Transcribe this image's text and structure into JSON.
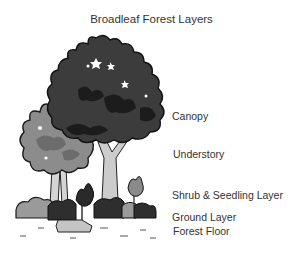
{
  "title": "Broadleaf Forest Layers",
  "labels": {
    "canopy": "Canopy",
    "understory": "Understory",
    "shrub": "Shrub & Seedling Layer",
    "ground": "Ground Layer",
    "floor": "Forest Floor"
  },
  "colors": {
    "canopy": "#3a3a3a",
    "canopy_shadow": "#1e1e1e",
    "understory": "#8a8a8a",
    "understory_shadow": "#6a6a6a",
    "trunk": "#cfcfcf",
    "shrub_dark": "#2e2e2e",
    "shrub_light": "#9a9a9a",
    "rock": "#bdbdbd"
  }
}
